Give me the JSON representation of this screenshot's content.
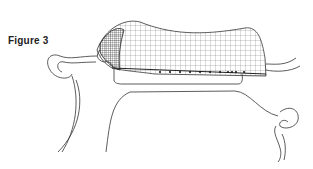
{
  "figure": {
    "caption": "Figure 3",
    "stroke_color": "#333333",
    "mesh_color": "#444444",
    "background": "#ffffff"
  }
}
